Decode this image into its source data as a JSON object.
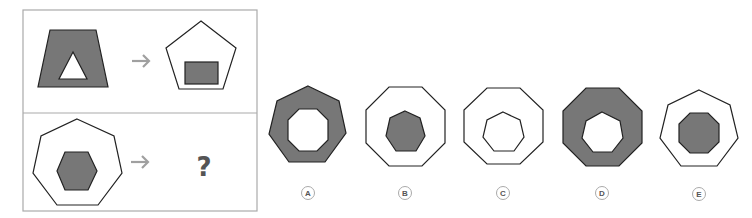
{
  "puzzle": {
    "question_mark": "?",
    "colors": {
      "fill": "#777777",
      "stroke": "#222222",
      "frame": "#aaaaaa",
      "arrow": "#a0a0a0",
      "label_circle": "#aaaaaa",
      "label_text": "#555555"
    },
    "example_row": {
      "source": "gray trapezoid with white triangle",
      "target": "white pentagon with gray rectangle"
    },
    "question_row": {
      "source": "white heptagon with gray hexagon",
      "target": "?"
    },
    "options": [
      {
        "label": "A",
        "description": "gray heptagon with white octagon"
      },
      {
        "label": "B",
        "description": "white octagon with gray heptagon"
      },
      {
        "label": "C",
        "description": "white octagon with white heptagon"
      },
      {
        "label": "D",
        "description": "gray octagon with white heptagon"
      },
      {
        "label": "E",
        "description": "white heptagon with gray octagon"
      }
    ]
  }
}
